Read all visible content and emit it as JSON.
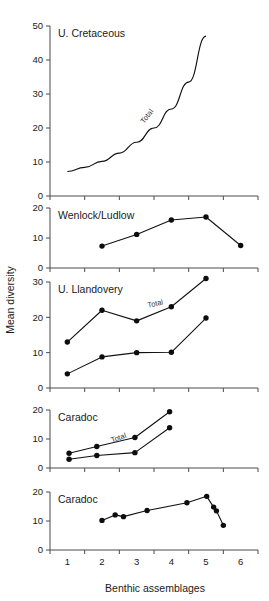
{
  "figure": {
    "y_axis_title": "Mean diversity",
    "x_axis_title": "Benthic assemblages",
    "x_tick_labels": [
      "1",
      "2",
      "3",
      "4",
      "5",
      "6"
    ],
    "series_inline_label": "Total"
  },
  "chart_data": [
    {
      "type": "line",
      "title": "U. Cretaceous",
      "panel_index": 0,
      "xlabel": "",
      "ylabel": "Mean diversity",
      "xlim": [
        0.5,
        6.5
      ],
      "ylim": [
        0,
        50
      ],
      "yticks": [
        0,
        10,
        20,
        30,
        40,
        50
      ],
      "grid": false,
      "annotations": [
        {
          "text": "Total",
          "x": 3.35,
          "y": 23,
          "rotation": -52
        }
      ],
      "series": [
        {
          "name": "Total",
          "style": "smooth-curve-no-markers",
          "x": [
            1.0,
            1.5,
            2.0,
            2.5,
            3.0,
            3.5,
            4.0,
            4.5,
            5.0
          ],
          "values": [
            7.2,
            8.4,
            10.2,
            12.6,
            15.8,
            20.0,
            25.6,
            33.5,
            47.0
          ]
        }
      ]
    },
    {
      "type": "line",
      "title": "Wenlock/Ludlow",
      "panel_index": 1,
      "xlabel": "",
      "ylabel": "Mean diversity",
      "xlim": [
        0.5,
        6.5
      ],
      "ylim": [
        0,
        20
      ],
      "yticks": [
        0,
        10,
        20
      ],
      "grid": false,
      "annotations": [],
      "series": [
        {
          "name": "Total",
          "style": "line-with-markers",
          "x": [
            2.0,
            3.0,
            4.0,
            5.0,
            6.0
          ],
          "values": [
            7.3,
            11.2,
            16.0,
            17.0,
            7.5
          ]
        }
      ]
    },
    {
      "type": "line",
      "title": "U. Llandovery",
      "panel_index": 2,
      "xlabel": "",
      "ylabel": "Mean diversity",
      "xlim": [
        0.5,
        6.5
      ],
      "ylim": [
        0,
        30
      ],
      "yticks": [
        0,
        10,
        20,
        30
      ],
      "grid": false,
      "annotations": [
        {
          "text": "Total",
          "x": 3.55,
          "y": 23.2,
          "rotation": -12
        }
      ],
      "series": [
        {
          "name": "Total",
          "style": "line-with-markers",
          "x": [
            1.0,
            2.0,
            3.0,
            4.0,
            5.0
          ],
          "values": [
            13.0,
            22.0,
            19.0,
            23.0,
            31.0
          ]
        },
        {
          "name": "lower",
          "style": "line-with-markers",
          "x": [
            1.0,
            2.0,
            3.0,
            4.0,
            5.0
          ],
          "values": [
            4.0,
            8.8,
            10.0,
            10.1,
            19.8
          ]
        }
      ]
    },
    {
      "type": "line",
      "title": "Caradoc",
      "panel_index": 3,
      "xlabel": "",
      "ylabel": "Mean diversity",
      "xlim": [
        0.5,
        6.5
      ],
      "ylim": [
        0,
        20
      ],
      "yticks": [
        0,
        10,
        20
      ],
      "grid": false,
      "annotations": [
        {
          "text": "Total",
          "x": 2.5,
          "y": 9.6,
          "rotation": -20
        }
      ],
      "series": [
        {
          "name": "Total",
          "style": "line-with-markers",
          "x": [
            1.05,
            1.85,
            2.95,
            3.95
          ],
          "values": [
            5.1,
            7.4,
            10.5,
            19.4
          ]
        },
        {
          "name": "lower",
          "style": "line-with-markers",
          "x": [
            1.05,
            1.85,
            2.95,
            3.95
          ],
          "values": [
            3.0,
            4.3,
            5.3,
            13.9
          ]
        }
      ]
    },
    {
      "type": "line",
      "title": "Caradoc",
      "panel_index": 4,
      "xlabel": "Benthic assemblages",
      "ylabel": "Mean diversity",
      "xlim": [
        0.5,
        6.5
      ],
      "ylim": [
        0,
        20
      ],
      "yticks": [
        0,
        10,
        20
      ],
      "xticks": [
        1,
        2,
        3,
        4,
        5,
        6
      ],
      "grid": false,
      "annotations": [],
      "series": [
        {
          "name": "Total",
          "style": "line-with-markers",
          "x": [
            2.0,
            2.38,
            2.62,
            3.3,
            4.45,
            5.02,
            5.22,
            5.3,
            5.5
          ],
          "values": [
            10.2,
            12.1,
            11.5,
            13.6,
            16.3,
            18.5,
            14.8,
            13.5,
            8.5
          ]
        }
      ]
    }
  ]
}
